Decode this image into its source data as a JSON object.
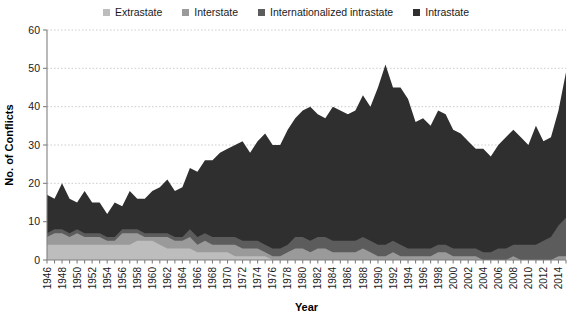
{
  "legend": {
    "position": "top-center",
    "items": [
      {
        "label": "Extrastate",
        "color": "#bdbdbd",
        "swatch_icon": "square-swatch-icon"
      },
      {
        "label": "Interstate",
        "color": "#9a9a9a",
        "swatch_icon": "square-swatch-icon"
      },
      {
        "label": "Internationalized intrastate",
        "color": "#5c5c5c",
        "swatch_icon": "square-swatch-icon"
      },
      {
        "label": "Intrastate",
        "color": "#2f2f2f",
        "swatch_icon": "square-swatch-icon"
      }
    ]
  },
  "axes": {
    "x_title": "Year",
    "y_title": "No. of Conflicts",
    "y_ticks": [
      "0",
      "10",
      "20",
      "30",
      "40",
      "50",
      "60"
    ],
    "x_ticks": [
      "1946",
      "1948",
      "1950",
      "1952",
      "1954",
      "1956",
      "1958",
      "1960",
      "1962",
      "1964",
      "1966",
      "1968",
      "1970",
      "1972",
      "1974",
      "1976",
      "1978",
      "1980",
      "1982",
      "1984",
      "1986",
      "1988",
      "1990",
      "1992",
      "1994",
      "1996",
      "1998",
      "2000",
      "2002",
      "2004",
      "2006",
      "2008",
      "2010",
      "2012",
      "2014"
    ]
  },
  "chart_data": {
    "type": "area",
    "stacked": true,
    "title": "",
    "xlabel": "Year",
    "ylabel": "No. of Conflicts",
    "xlim": [
      1946,
      2015
    ],
    "ylim": [
      0,
      60
    ],
    "grid": true,
    "legend_position": "top",
    "x": [
      1946,
      1947,
      1948,
      1949,
      1950,
      1951,
      1952,
      1953,
      1954,
      1955,
      1956,
      1957,
      1958,
      1959,
      1960,
      1961,
      1962,
      1963,
      1964,
      1965,
      1966,
      1967,
      1968,
      1969,
      1970,
      1971,
      1972,
      1973,
      1974,
      1975,
      1976,
      1977,
      1978,
      1979,
      1980,
      1981,
      1982,
      1983,
      1984,
      1985,
      1986,
      1987,
      1988,
      1989,
      1990,
      1991,
      1992,
      1993,
      1994,
      1995,
      1996,
      1997,
      1998,
      1999,
      2000,
      2001,
      2002,
      2003,
      2004,
      2005,
      2006,
      2007,
      2008,
      2009,
      2010,
      2011,
      2012,
      2013,
      2014,
      2015
    ],
    "series": [
      {
        "name": "Extrastate",
        "color": "#bdbdbd",
        "values": [
          4,
          4,
          4,
          4,
          4,
          4,
          4,
          4,
          4,
          4,
          4,
          4,
          5,
          5,
          5,
          4,
          3,
          3,
          3,
          3,
          2,
          2,
          2,
          2,
          2,
          1,
          1,
          1,
          1,
          1,
          0,
          0,
          0,
          0,
          0,
          0,
          0,
          0,
          0,
          0,
          0,
          0,
          0,
          0,
          0,
          0,
          0,
          0,
          0,
          0,
          0,
          0,
          0,
          0,
          0,
          0,
          0,
          0,
          0,
          0,
          0,
          0,
          0,
          0,
          0,
          0,
          0,
          0,
          0,
          0
        ]
      },
      {
        "name": "Interstate",
        "color": "#9a9a9a",
        "values": [
          2,
          3,
          3,
          2,
          3,
          2,
          2,
          2,
          1,
          1,
          3,
          3,
          2,
          1,
          1,
          2,
          3,
          2,
          2,
          3,
          2,
          3,
          2,
          2,
          2,
          3,
          2,
          2,
          2,
          1,
          1,
          1,
          2,
          3,
          3,
          2,
          3,
          3,
          2,
          2,
          2,
          2,
          3,
          2,
          1,
          1,
          2,
          1,
          1,
          1,
          1,
          1,
          2,
          2,
          1,
          1,
          1,
          1,
          0,
          0,
          0,
          0,
          1,
          0,
          0,
          0,
          0,
          0,
          1,
          1
        ]
      },
      {
        "name": "Internationalized intrastate",
        "color": "#5c5c5c",
        "values": [
          1,
          1,
          1,
          1,
          1,
          1,
          1,
          1,
          1,
          1,
          1,
          1,
          1,
          1,
          1,
          1,
          1,
          1,
          1,
          2,
          2,
          2,
          2,
          2,
          2,
          2,
          2,
          2,
          2,
          2,
          2,
          2,
          2,
          3,
          3,
          3,
          3,
          3,
          3,
          3,
          3,
          3,
          3,
          3,
          3,
          3,
          3,
          3,
          2,
          2,
          2,
          2,
          2,
          2,
          2,
          2,
          2,
          2,
          2,
          2,
          3,
          3,
          3,
          4,
          4,
          4,
          5,
          6,
          8,
          10
        ]
      },
      {
        "name": "Intrastate",
        "color": "#2f2f2f",
        "values": [
          10,
          8,
          12,
          9,
          7,
          11,
          8,
          8,
          6,
          9,
          6,
          10,
          8,
          9,
          11,
          12,
          14,
          12,
          13,
          16,
          17,
          19,
          20,
          22,
          23,
          24,
          26,
          23,
          26,
          29,
          27,
          27,
          30,
          31,
          33,
          35,
          32,
          31,
          35,
          34,
          33,
          34,
          37,
          35,
          41,
          47,
          40,
          41,
          39,
          33,
          34,
          32,
          35,
          34,
          31,
          30,
          28,
          26,
          27,
          25,
          27,
          29,
          30,
          28,
          26,
          31,
          26,
          26,
          30,
          38
        ]
      }
    ]
  }
}
